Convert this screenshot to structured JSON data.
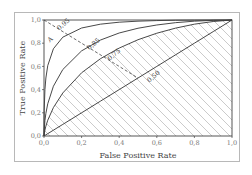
{
  "chart_data": {
    "type": "line",
    "title": "",
    "xlabel": "False Positive Rate",
    "ylabel": "True Positive Rate",
    "xlim": [
      0.0,
      1.0
    ],
    "ylim": [
      0.0,
      1.0
    ],
    "grid": false,
    "legend": "none",
    "x_ticks": [
      "0,0",
      "0,2",
      "0,4",
      "0,6",
      "0,8",
      "1,0"
    ],
    "y_ticks": [
      "0,0",
      "0,2",
      "0,4",
      "0,6",
      "0,8",
      "1,0"
    ],
    "x_tick_values": [
      0.0,
      0.2,
      0.4,
      0.6,
      0.8,
      1.0
    ],
    "y_tick_values": [
      0.0,
      0.2,
      0.4,
      0.6,
      0.8,
      1.0
    ],
    "x": [
      0.0,
      0.001,
      0.005,
      0.01,
      0.02,
      0.05,
      0.1,
      0.2,
      0.3,
      0.4,
      0.5,
      0.6,
      0.7,
      0.8,
      0.9,
      1.0
    ],
    "series": [
      {
        "name": "AUC 0.95",
        "label": "0,95",
        "values": [
          0.0,
          0.222,
          0.401,
          0.5,
          0.607,
          0.752,
          0.852,
          0.931,
          0.964,
          0.981,
          0.99,
          0.995,
          0.998,
          0.999,
          1.0,
          1.0
        ]
      },
      {
        "name": "AUC 0.85",
        "label": "0,85",
        "values": [
          0.0,
          0.052,
          0.134,
          0.195,
          0.278,
          0.429,
          0.573,
          0.734,
          0.827,
          0.888,
          0.929,
          0.957,
          0.977,
          0.99,
          0.997,
          1.0
        ]
      },
      {
        "name": "AUC 0.75",
        "label": "0,75",
        "values": [
          0.0,
          0.016,
          0.052,
          0.085,
          0.136,
          0.245,
          0.371,
          0.545,
          0.666,
          0.758,
          0.83,
          0.886,
          0.93,
          0.964,
          0.987,
          1.0
        ]
      },
      {
        "name": "AUC 0.50",
        "label": "0,50",
        "values": [
          0.0,
          0.001,
          0.005,
          0.01,
          0.02,
          0.05,
          0.1,
          0.2,
          0.3,
          0.4,
          0.5,
          0.6,
          0.7,
          0.8,
          0.9,
          1.0
        ]
      }
    ],
    "annotations": [
      {
        "text": "A",
        "x": 0.04,
        "y": 0.82,
        "note": "point on dashed anti-diagonal"
      },
      {
        "text": "0,95",
        "x": 0.11,
        "y": 0.95
      },
      {
        "text": "0,85",
        "x": 0.27,
        "y": 0.78
      },
      {
        "text": "0,75",
        "x": 0.38,
        "y": 0.69
      },
      {
        "text": "0,50",
        "x": 0.59,
        "y": 0.5
      }
    ],
    "dashed_line": {
      "from": [
        0.0,
        1.0
      ],
      "to": [
        0.5,
        0.5
      ]
    },
    "hatched_region": "area under AUC 0.75 curve"
  },
  "labels": {
    "xlabel": "False Positive Rate",
    "ylabel": "True Positive Rate",
    "point_a": "A"
  },
  "colors": {
    "curve": "#333333",
    "hatch": "#b5b5b5",
    "axis": "#444444",
    "frame": "#b8b8b8"
  }
}
